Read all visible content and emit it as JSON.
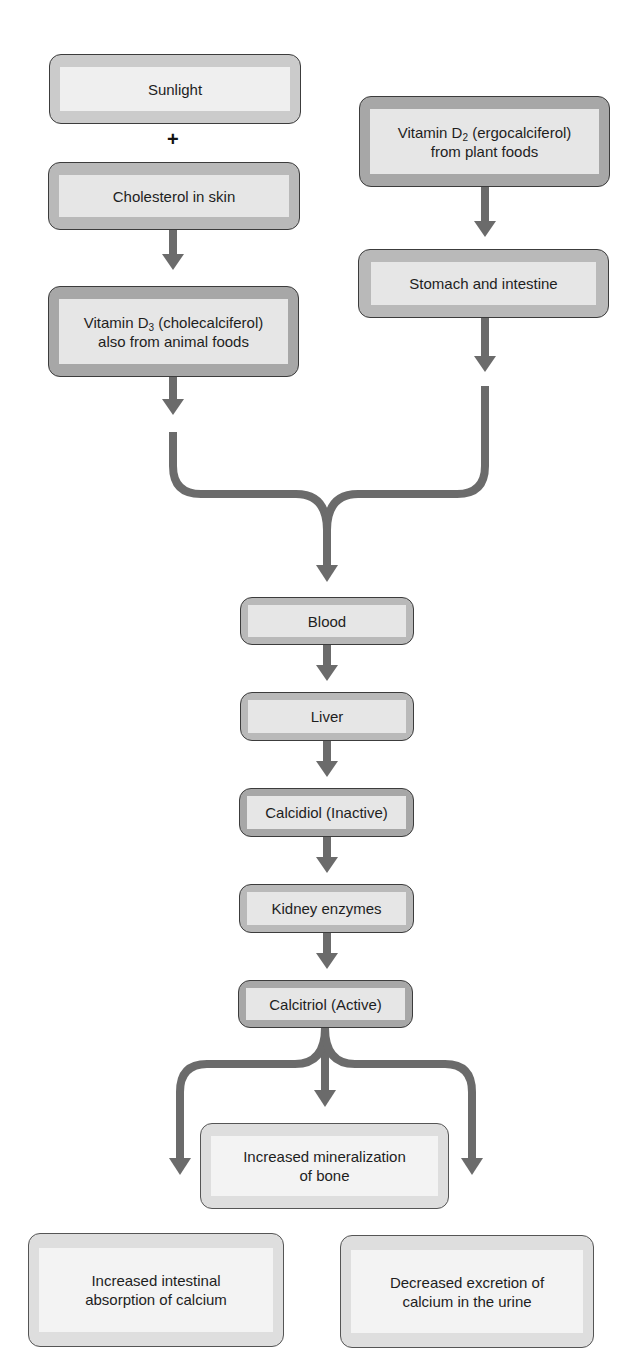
{
  "diagram": {
    "colors": {
      "arrow": "#6b6b6b",
      "border": "#3c3c3c",
      "frame_dark": "#a7a7a7",
      "frame_light": "#cbcbcb",
      "inner": "#e6e6e6"
    },
    "nodes": {
      "sunlight": {
        "label": "Sunlight"
      },
      "plus": {
        "label": "+"
      },
      "cholesterol": {
        "label": "Cholesterol in skin"
      },
      "vitamin_d3": {
        "line1_pre": "Vitamin D",
        "line1_sub": "3",
        "line1_post": " (cholecalciferol)",
        "line2": "also from animal foods"
      },
      "vitamin_d2": {
        "line1_pre": "Vitamin D",
        "line1_sub": "2",
        "line1_post": " (ergocalciferol)",
        "line2": "from plant foods"
      },
      "stomach": {
        "label": "Stomach and intestine"
      },
      "blood": {
        "label": "Blood"
      },
      "liver": {
        "label": "Liver"
      },
      "calcidiol": {
        "label": "Calcidiol (Inactive)"
      },
      "kidney": {
        "label": "Kidney enzymes"
      },
      "calcitriol": {
        "label": "Calcitriol (Active)"
      },
      "bone": {
        "line1": "Increased mineralization",
        "line2": "of bone"
      },
      "intestinal": {
        "line1": "Increased intestinal",
        "line2": "absorption of calcium"
      },
      "excretion": {
        "line1": "Decreased excretion of",
        "line2": "calcium in the urine"
      }
    },
    "edges": [
      [
        "sunlight",
        "cholesterol"
      ],
      [
        "cholesterol",
        "vitamin_d3"
      ],
      [
        "vitamin_d2",
        "stomach"
      ],
      [
        "vitamin_d3",
        "blood"
      ],
      [
        "stomach",
        "blood"
      ],
      [
        "blood",
        "liver"
      ],
      [
        "liver",
        "calcidiol"
      ],
      [
        "calcidiol",
        "kidney"
      ],
      [
        "kidney",
        "calcitriol"
      ],
      [
        "calcitriol",
        "bone"
      ],
      [
        "calcitriol",
        "intestinal"
      ],
      [
        "calcitriol",
        "excretion"
      ]
    ]
  }
}
